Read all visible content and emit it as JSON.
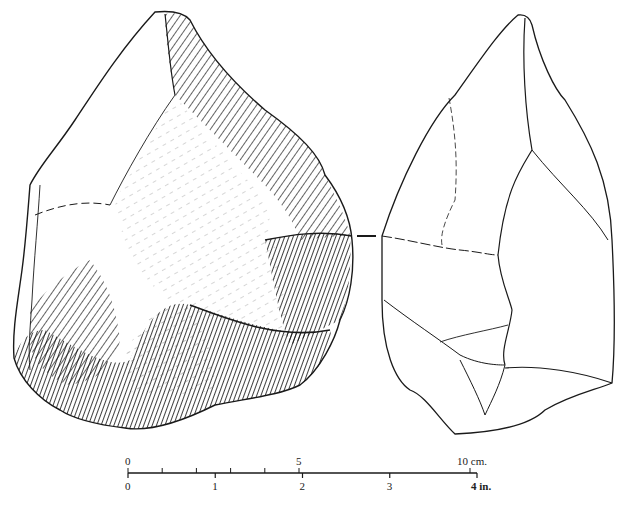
{
  "figure": {
    "views": [
      {
        "name": "face-view",
        "description": "Face view of hand axe with hatched flake scars"
      },
      {
        "name": "side-view",
        "description": "Side/profile view outline of hand axe"
      }
    ],
    "ink_color": "#1a1a1a",
    "paper_color": "#ffffff"
  },
  "scale_bar": {
    "cm": {
      "max": 10,
      "unit_label": "10 cm.",
      "labels": [
        "0",
        "5"
      ],
      "minor_ticks": [
        0,
        1,
        2,
        3,
        4,
        5,
        10
      ]
    },
    "inch": {
      "max": 4,
      "unit_label": "4 in.",
      "labels": [
        "0",
        "1",
        "2",
        "3"
      ],
      "ticks": [
        0,
        1,
        2,
        3,
        4
      ]
    }
  }
}
